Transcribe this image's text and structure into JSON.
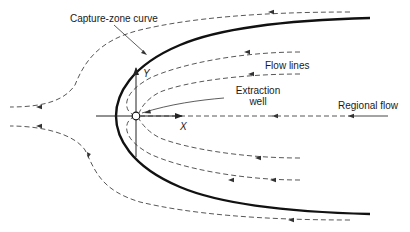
{
  "labels": {
    "capture_zone": "Capture-zone curve",
    "flow_lines": "Flow lines",
    "extraction_well_line1": "Extraction",
    "extraction_well_line2": "well",
    "regional_flow": "Regional flow",
    "x_axis": "X",
    "y_axis": "Y"
  },
  "colors": {
    "capture_curve": "#111111",
    "flow_lines": "#444444",
    "axes": "#222222",
    "background": "#ffffff"
  }
}
